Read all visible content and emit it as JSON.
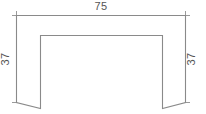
{
  "drawing": {
    "title": "U-profile section drawing",
    "background_color": "#ffffff",
    "line_color": "#8a8a8a",
    "dimension_line_color": "#9a9a9a",
    "text_color": "#555555"
  },
  "dimensions": {
    "top_width": {
      "label": "75",
      "orientation": "horizontal",
      "position": "top-center"
    },
    "left_height": {
      "label": "37",
      "orientation": "vertical-rotated",
      "position": "left"
    },
    "right_height": {
      "label": "37",
      "orientation": "vertical-rotated",
      "position": "right"
    }
  },
  "geometry": {
    "type": "u-profile",
    "outer_top_y": 15,
    "outer_left_x": 16,
    "outer_right_x": 186,
    "inner_top_y": 35,
    "inner_left_x": 40,
    "inner_right_x": 162,
    "foot_bottom_outer_y": 102,
    "foot_bottom_inner_y": 108
  }
}
